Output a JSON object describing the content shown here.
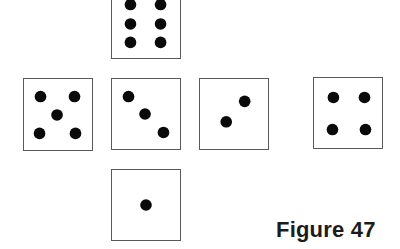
{
  "figure": {
    "caption": "Figure 47"
  },
  "faces": [
    {
      "id": "top",
      "value": 6,
      "box": {
        "x": 111,
        "y": -14,
        "w": 70,
        "h": 73
      },
      "pips": [
        [
          19,
          18
        ],
        [
          50,
          18
        ],
        [
          19,
          38
        ],
        [
          50,
          38
        ],
        [
          19,
          57
        ],
        [
          50,
          57
        ]
      ]
    },
    {
      "id": "left",
      "value": 5,
      "box": {
        "x": 23,
        "y": 78,
        "w": 70,
        "h": 73
      },
      "pips": [
        [
          17,
          18
        ],
        [
          52,
          18
        ],
        [
          34,
          37
        ],
        [
          16,
          56
        ],
        [
          53,
          56
        ]
      ]
    },
    {
      "id": "center",
      "value": 3,
      "box": {
        "x": 111,
        "y": 78,
        "w": 70,
        "h": 72
      },
      "pips": [
        [
          17,
          18
        ],
        [
          34,
          36
        ],
        [
          53,
          55
        ]
      ]
    },
    {
      "id": "right",
      "value": 2,
      "box": {
        "x": 199,
        "y": 78,
        "w": 70,
        "h": 72
      },
      "pips": [
        [
          46,
          23
        ],
        [
          27,
          44
        ]
      ]
    },
    {
      "id": "far-right",
      "value": 4,
      "box": {
        "x": 313,
        "y": 77,
        "w": 70,
        "h": 72
      },
      "pips": [
        [
          20,
          20
        ],
        [
          52,
          20
        ],
        [
          19,
          53
        ],
        [
          53,
          53
        ]
      ]
    },
    {
      "id": "bottom",
      "value": 1,
      "box": {
        "x": 111,
        "y": 169,
        "w": 70,
        "h": 72
      },
      "pips": [
        [
          35,
          36
        ]
      ]
    }
  ],
  "style": {
    "pip_radius": 6,
    "pip_color": "#0a0a0a",
    "border_color": "#5a5a5a",
    "background": "#ffffff"
  }
}
